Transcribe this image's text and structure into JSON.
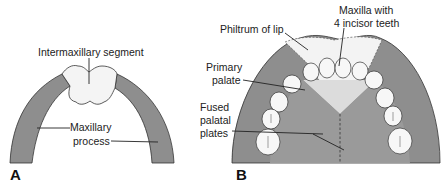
{
  "figure": {
    "panels": [
      {
        "id": "A",
        "label": "A",
        "annotations": {
          "intermaxillary": "Intermaxillary segment",
          "maxillary_line1": "Maxillary",
          "maxillary_line2": "process"
        }
      },
      {
        "id": "B",
        "label": "B",
        "annotations": {
          "philtrum": "Philtrum of lip",
          "maxilla_line1": "Maxilla with",
          "maxilla_line2": "4 incisor teeth",
          "primary_line1": "Primary",
          "primary_line2": "palate",
          "fused_line1": "Fused",
          "fused_line2": "palatal",
          "fused_line3": "plates"
        }
      }
    ],
    "colors": {
      "maxillary_gray": "#8e8e8e",
      "palate_gray": "#9a9a9a",
      "light_segment": "#f2f2f2",
      "outline": "#333333"
    }
  }
}
